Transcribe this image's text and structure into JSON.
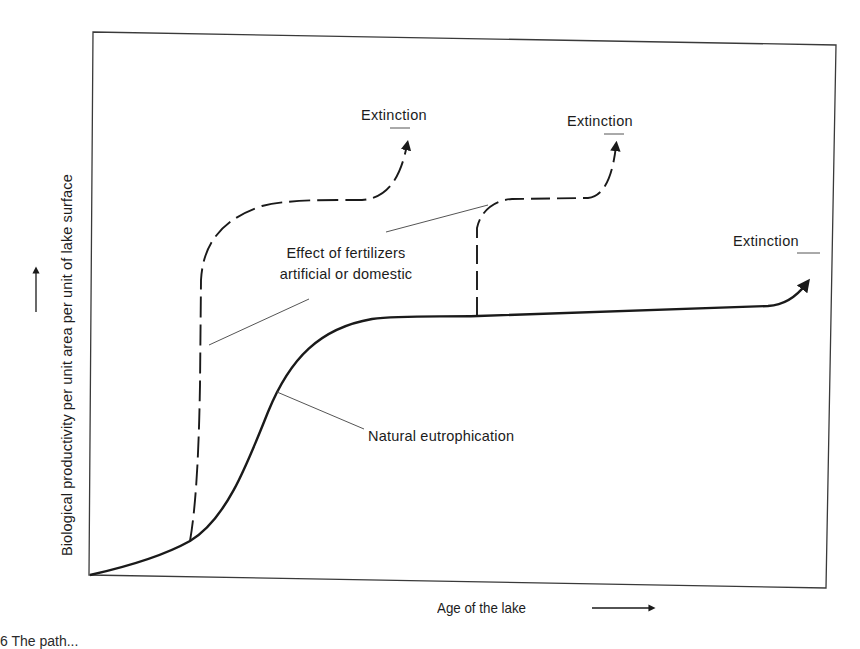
{
  "figure": {
    "type": "conceptual curve diagram",
    "y_axis_label": "Biological productivity per unit area per unit of lake surface",
    "x_axis_label": "Age of the lake",
    "curves": {
      "natural": {
        "label": "Natural eutrophication",
        "style": "solid",
        "endpoint_label": "Extinction"
      },
      "fertilizer_early": {
        "style": "dashed",
        "endpoint_label": "Extinction"
      },
      "fertilizer_late": {
        "style": "dashed",
        "endpoint_label": "Extinction"
      }
    },
    "fertilizer_annotation": {
      "line1": "Effect of fertilizers",
      "line2": "artificial or domestic"
    },
    "caption_fragment": "6  The path..."
  },
  "colors": {
    "ink": "#1a1a1a",
    "leader": "#555555",
    "frame": "#3a3a3a",
    "background": "#ffffff"
  }
}
